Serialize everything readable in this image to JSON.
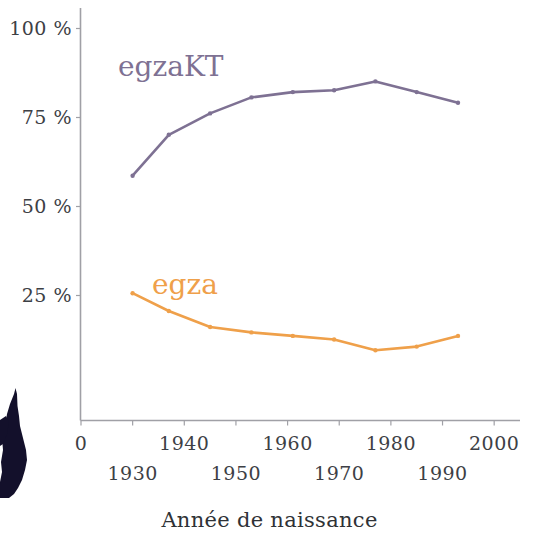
{
  "chart_data": {
    "type": "line",
    "title": "",
    "xlabel": "Année de naissance",
    "ylabel": "",
    "xlim": [
      1920,
      2005
    ],
    "ylim": [
      0,
      105
    ],
    "grid": false,
    "legend_position": "inline-annotation",
    "x_tick_labels_row1": [
      "0",
      "1940",
      "1960",
      "1980",
      "2000"
    ],
    "x_tick_labels_row2": [
      "1930",
      "1950",
      "1970",
      "1990"
    ],
    "x_ticks": [
      1920,
      1930,
      1940,
      1950,
      1960,
      1970,
      1980,
      1990,
      2000
    ],
    "y_tick_labels": [
      "100 %",
      "75 %",
      "50 %",
      "25 %"
    ],
    "y_ticks": [
      100,
      75,
      50,
      25
    ],
    "x": [
      1929,
      1936,
      1944,
      1952,
      1960,
      1968,
      1976,
      1984,
      1992,
      1998
    ],
    "series": [
      {
        "name": "egzaKT",
        "color": "#7e7193",
        "x": [
          1930,
          1937,
          1945,
          1953,
          1961,
          1969,
          1977,
          1985,
          1993
        ],
        "values": [
          58.5,
          70,
          76,
          80.5,
          82,
          82.5,
          85,
          82,
          79
        ]
      },
      {
        "name": "egza",
        "color": "#efa04a",
        "x": [
          1930,
          1937,
          1945,
          1953,
          1961,
          1969,
          1977,
          1985,
          1993
        ],
        "values": [
          25.5,
          20.5,
          16,
          14.5,
          13.5,
          12.5,
          9.5,
          10.5,
          13.5
        ]
      }
    ]
  },
  "annotations": {
    "egzakt_label": "egzaKT",
    "egza_label": "egza"
  },
  "axis": {
    "x_title": "Année de naissance"
  },
  "colors": {
    "purple": "#7e7193",
    "orange": "#efa04a",
    "axis": "#9a9a9f",
    "tick_text": "#3d4045",
    "silhouette": "#13102b"
  }
}
